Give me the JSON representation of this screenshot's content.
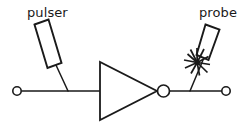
{
  "diagram": {
    "background_color": "#ffffff",
    "ink_color": "#1a1a1a",
    "labels": {
      "pulser": "pulser",
      "probe": "probe"
    },
    "components": [
      {
        "id": "pulser",
        "kind": "transducer-block",
        "label": "pulser",
        "icon": "tilted-rectangle",
        "tilt_degrees": 21,
        "attached_to": "input-wire"
      },
      {
        "id": "input-terminal",
        "kind": "terminal",
        "icon": "open-circle-terminal"
      },
      {
        "id": "inverter",
        "kind": "logic-gate",
        "icon": "inverter-triangle-with-bubble"
      },
      {
        "id": "probe",
        "kind": "transducer-block",
        "label": "probe",
        "icon": "tilted-rectangle",
        "tilt_degrees": -21,
        "attached_to": "output-wire"
      },
      {
        "id": "spark",
        "kind": "annotation",
        "icon": "spark-burst-icon"
      },
      {
        "id": "output-terminal",
        "kind": "terminal",
        "icon": "open-circle-terminal"
      }
    ],
    "wires": [
      {
        "id": "input-wire",
        "from": "input-terminal",
        "to": "inverter"
      },
      {
        "id": "output-wire",
        "from": "inverter",
        "to": "output-terminal"
      }
    ]
  }
}
